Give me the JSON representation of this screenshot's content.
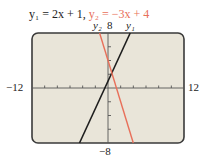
{
  "title": {
    "eq1": "y₁ = 2x + 1,",
    "eq2": "y₂ = −3x + 4"
  },
  "labels": {
    "xmin": "−12",
    "xmax": "12",
    "ymax": "8",
    "ymin": "−8",
    "line1": "y₁",
    "line2": "y₂"
  },
  "colors": {
    "screen_bg": "#e9e5d9",
    "frame": "#3a3a3a",
    "line1": "#1e1e1e",
    "line2": "#e8705a"
  },
  "chart_data": {
    "type": "line",
    "xlabel": "",
    "ylabel": "",
    "xlim": [
      -12,
      12
    ],
    "ylim": [
      -8,
      8
    ],
    "xticks_step": 2,
    "yticks_step": 2,
    "grid": false,
    "series": [
      {
        "name": "y1",
        "equation": "y = 2x + 1",
        "color": "#1e1e1e",
        "x": [
          -4.5,
          3.5
        ],
        "y": [
          -8,
          8
        ]
      },
      {
        "name": "y2",
        "equation": "y = -3x + 4",
        "color": "#e8705a",
        "x": [
          -1.333,
          4
        ],
        "y": [
          8,
          -8
        ]
      }
    ],
    "annotations": [
      {
        "text": "y1",
        "position": "top end of y1 line"
      },
      {
        "text": "y2",
        "position": "top end of y2 line"
      }
    ]
  }
}
